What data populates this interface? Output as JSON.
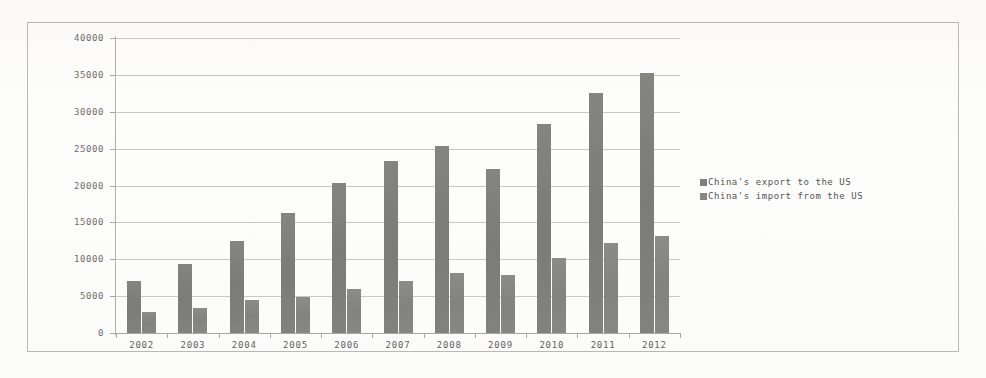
{
  "chart_data": {
    "type": "bar",
    "title": "",
    "xlabel": "",
    "ylabel": "",
    "ylim": [
      0,
      40000
    ],
    "ytick_values": [
      0,
      5000,
      10000,
      15000,
      20000,
      25000,
      30000,
      35000,
      40000
    ],
    "ytick_labels": [
      "0",
      "5000",
      "10000",
      "15000",
      "20000",
      "25000",
      "30000",
      "35000",
      "40000"
    ],
    "grid": true,
    "legend_position": "right",
    "categories": [
      "2002",
      "2003",
      "2004",
      "2005",
      "2006",
      "2007",
      "2008",
      "2009",
      "2010",
      "2011",
      "2012"
    ],
    "series": [
      {
        "name": "China's export to the US",
        "color": "#7f7f7c",
        "values": [
          7000,
          9300,
          12500,
          16300,
          20400,
          23300,
          25300,
          22200,
          28400,
          32500,
          35300
        ]
      },
      {
        "name": "China's import from the US",
        "color": "#868683",
        "values": [
          2800,
          3400,
          4500,
          4900,
          6000,
          7000,
          8100,
          7800,
          10200,
          12200,
          13200
        ]
      }
    ]
  },
  "legend": {
    "entries": [
      {
        "label": "China's export to the US"
      },
      {
        "label": "China's import from the US"
      }
    ]
  },
  "colors": {
    "export_bar": "#7f7f7c",
    "import_bar": "#868683",
    "gridline": "#c9c9c4",
    "axis": "#a8a8a3",
    "frame": "#b9b9b4",
    "background": "#fdfdfc",
    "tick_text": "#6d6d68"
  }
}
